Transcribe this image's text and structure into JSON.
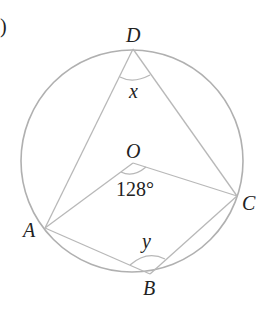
{
  "figure": {
    "corner_mark": ")",
    "points": {
      "D": {
        "label": "D",
        "x": 133,
        "y": 49
      },
      "O": {
        "label": "O",
        "x": 133,
        "y": 163
      },
      "A": {
        "label": "A",
        "x": 45,
        "y": 228
      },
      "B": {
        "label": "B",
        "x": 150,
        "y": 274
      },
      "C": {
        "label": "C",
        "x": 237,
        "y": 196
      }
    },
    "angles": {
      "x_label": "x",
      "y_label": "y",
      "center_angle": "128°"
    },
    "circle": {
      "cx": 132,
      "cy": 161,
      "r": 111
    },
    "colors": {
      "line": "#b8b8b8",
      "text": "#222222"
    }
  }
}
